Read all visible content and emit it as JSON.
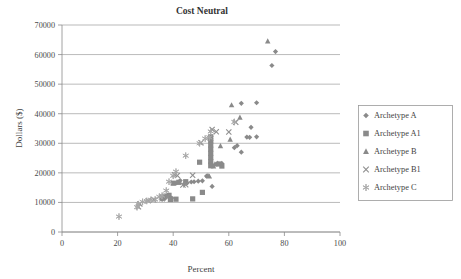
{
  "chart_data": {
    "type": "scatter",
    "title": "Cost Neutral",
    "xlabel": "Percent",
    "ylabel": "Dollars ($)",
    "xlim": [
      0,
      100
    ],
    "ylim": [
      0,
      70000
    ],
    "xticks": [
      "0",
      "20",
      "40",
      "60",
      "80",
      "100"
    ],
    "xtick_values": [
      0,
      20,
      40,
      60,
      80,
      100
    ],
    "yticks": [
      "0",
      "10000",
      "20000",
      "30000",
      "40000",
      "50000",
      "60000",
      "70000"
    ],
    "ytick_values": [
      0,
      10000,
      20000,
      30000,
      40000,
      50000,
      60000,
      70000
    ],
    "grid": "horizontal",
    "legend_position": "right",
    "marker_color": "#8a8a8a",
    "series": [
      {
        "name": "Archetype A",
        "marker": "diamond",
        "points": [
          [
            76.8,
            61000
          ],
          [
            75.5,
            56300
          ],
          [
            70.0,
            43700
          ],
          [
            64.5,
            43500
          ],
          [
            68.0,
            35400
          ],
          [
            66.5,
            32100
          ],
          [
            67.5,
            32000
          ],
          [
            70.0,
            32200
          ],
          [
            63.0,
            29200
          ],
          [
            62.0,
            28500
          ],
          [
            64.5,
            27000
          ],
          [
            57.5,
            23200
          ],
          [
            55.5,
            23000
          ],
          [
            53.5,
            23400
          ],
          [
            54.0,
            15400
          ],
          [
            52.0,
            18900
          ],
          [
            50.5,
            17300
          ],
          [
            49.0,
            17200
          ],
          [
            47.5,
            17000
          ],
          [
            46.5,
            16900
          ],
          [
            45.0,
            16600
          ],
          [
            44.0,
            16300
          ],
          [
            42.5,
            17400
          ],
          [
            41.0,
            16500
          ],
          [
            39.5,
            11500
          ],
          [
            38.0,
            12200
          ],
          [
            37.0,
            11300
          ],
          [
            36.0,
            11000
          ]
        ]
      },
      {
        "name": "Archetype A1",
        "marker": "square",
        "points": [
          [
            53.5,
            32200
          ],
          [
            53.5,
            30800
          ],
          [
            53.5,
            29400
          ],
          [
            53.5,
            28000
          ],
          [
            53.5,
            26600
          ],
          [
            53.5,
            25200
          ],
          [
            53.5,
            23800
          ],
          [
            53.5,
            22400
          ],
          [
            56.5,
            23000
          ],
          [
            57.5,
            22300
          ],
          [
            49.5,
            23600
          ],
          [
            50.5,
            13400
          ],
          [
            47.0,
            11200
          ],
          [
            44.5,
            17000
          ],
          [
            42.0,
            16800
          ],
          [
            40.0,
            16500
          ],
          [
            38.5,
            12400
          ],
          [
            37.0,
            12100
          ],
          [
            36.0,
            11800
          ],
          [
            41.0,
            11100
          ],
          [
            39.0,
            11000
          ]
        ]
      },
      {
        "name": "Archetype B",
        "marker": "triangle",
        "points": [
          [
            74.0,
            64500
          ],
          [
            64.0,
            38700
          ],
          [
            61.0,
            42900
          ],
          [
            60.5,
            31300
          ],
          [
            57.0,
            29100
          ],
          [
            56.0,
            23200
          ],
          [
            55.0,
            22900
          ],
          [
            54.5,
            22200
          ],
          [
            53.0,
            18800
          ],
          [
            52.5,
            19000
          ]
        ]
      },
      {
        "name": "Archetype B1",
        "marker": "x",
        "points": [
          [
            62.5,
            37100
          ],
          [
            60.0,
            33800
          ],
          [
            55.5,
            33900
          ],
          [
            54.0,
            34700
          ],
          [
            53.5,
            31600
          ],
          [
            50.0,
            30200
          ],
          [
            47.0,
            19200
          ],
          [
            44.5,
            16000
          ],
          [
            43.5,
            15900
          ],
          [
            41.5,
            19100
          ],
          [
            40.5,
            19400
          ],
          [
            38.0,
            11900
          ],
          [
            36.0,
            11200
          ],
          [
            33.0,
            10900
          ],
          [
            31.0,
            10600
          ],
          [
            28.0,
            9500
          ],
          [
            27.5,
            8500
          ]
        ]
      },
      {
        "name": "Archetype C",
        "marker": "asterisk",
        "points": [
          [
            62.0,
            37200
          ],
          [
            53.5,
            34000
          ],
          [
            53.0,
            32000
          ],
          [
            51.5,
            31600
          ],
          [
            49.5,
            30000
          ],
          [
            44.5,
            25800
          ],
          [
            41.0,
            20400
          ],
          [
            40.0,
            19000
          ],
          [
            38.5,
            17000
          ],
          [
            37.5,
            14000
          ],
          [
            36.0,
            12300
          ],
          [
            35.0,
            11900
          ],
          [
            33.5,
            11000
          ],
          [
            32.0,
            10900
          ],
          [
            30.5,
            10500
          ],
          [
            29.0,
            10200
          ],
          [
            27.5,
            9400
          ],
          [
            27.0,
            8400
          ],
          [
            20.5,
            5200
          ]
        ]
      }
    ]
  },
  "legend": {
    "entries": [
      {
        "label": "Archetype A",
        "marker": "diamond"
      },
      {
        "label": "Archetype A1",
        "marker": "square"
      },
      {
        "label": "Archetype B",
        "marker": "triangle"
      },
      {
        "label": "Archetype B1",
        "marker": "x"
      },
      {
        "label": "Archetype C",
        "marker": "asterisk"
      }
    ]
  }
}
